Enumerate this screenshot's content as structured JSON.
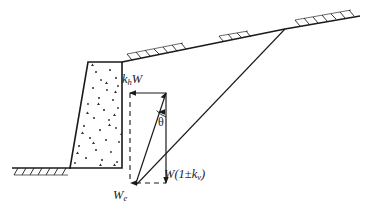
{
  "figure": {
    "type": "engineering-diagram",
    "background_color": "#ffffff",
    "line_color": "#1a1a1a"
  },
  "labels": {
    "horizontal_force": {
      "base": "k",
      "subscript": "h",
      "suffix": "W",
      "full_text": "khW",
      "meaning": "horizontal-seismic-inertia-force"
    },
    "vertical_force": {
      "prefix": "W(1±k",
      "subscript": "v",
      "suffix": ")",
      "full_text": "W(1±kv)",
      "meaning": "vertical-force-with-seismic-coefficient"
    },
    "resultant_force": {
      "base": "W",
      "subscript": "e",
      "full_text": "We",
      "meaning": "resultant-equivalent-weight"
    },
    "angle": {
      "symbol": "θ",
      "full_text": "θ",
      "meaning": "seismic-inertia-angle"
    }
  },
  "geometry": {
    "ground_line_y": 168,
    "wall": {
      "top_left_x": 88,
      "top_right_x": 122,
      "top_y": 62,
      "base_left_x": 70,
      "base_right_x": 122,
      "base_y": 168
    },
    "backfill_slope": {
      "start_x": 122,
      "start_y": 62,
      "bend_x": 285,
      "bend_y": 29,
      "end_x": 360,
      "end_y": 16
    },
    "failure_wedge_line": {
      "from_x": 136,
      "from_y": 185,
      "to_x": 285,
      "to_y": 29
    },
    "force_polygon": {
      "top_left_x": 130,
      "top_y": 93,
      "top_right_x": 166,
      "bottom_y": 183,
      "dashed_left_x": 130,
      "resultant_from_x": 136,
      "resultant_to_x": 166
    }
  },
  "colors": {
    "line": "#1a1a1a",
    "stipple": "#2b2b2b",
    "background": "#ffffff"
  }
}
